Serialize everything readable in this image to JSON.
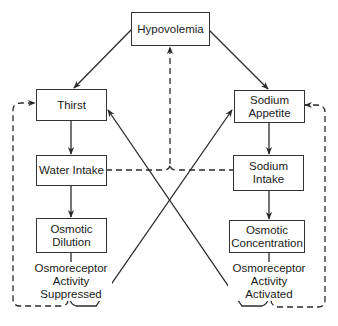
{
  "diagram": {
    "nodes": {
      "hypovolemia": "Hypovolemia",
      "thirst": "Thirst",
      "sodium_appetite": [
        "Sodium",
        "Appetite"
      ],
      "water_intake": "Water Intake",
      "sodium_intake": [
        "Sodium",
        "Intake"
      ],
      "osmotic_dilution": [
        "Osmotic",
        "Dilution"
      ],
      "osmotic_concentration": [
        "Osmotic",
        "Concentration"
      ]
    },
    "labels": {
      "osmoreceptor_suppressed": [
        "Osmoreceptor",
        "Activity",
        "Suppressed"
      ],
      "osmoreceptor_activated": [
        "Osmoreceptor",
        "Activity",
        "Activated"
      ]
    },
    "edges": [
      {
        "from": "hypovolemia",
        "to": "thirst",
        "style": "solid"
      },
      {
        "from": "hypovolemia",
        "to": "sodium_appetite",
        "style": "solid"
      },
      {
        "from": "thirst",
        "to": "water_intake",
        "style": "solid"
      },
      {
        "from": "water_intake",
        "to": "osmotic_dilution",
        "style": "solid"
      },
      {
        "from": "sodium_appetite",
        "to": "sodium_intake",
        "style": "solid"
      },
      {
        "from": "sodium_intake",
        "to": "osmotic_concentration",
        "style": "solid"
      },
      {
        "from": "osmoreceptor_suppressed",
        "to": "sodium_appetite",
        "style": "solid"
      },
      {
        "from": "osmoreceptor_activated",
        "to": "thirst",
        "style": "solid"
      },
      {
        "from": "water_intake+sodium_intake",
        "to": "hypovolemia",
        "style": "dashed"
      },
      {
        "from": "osmoreceptor_suppressed",
        "to": "thirst",
        "style": "dashed"
      },
      {
        "from": "osmoreceptor_activated",
        "to": "sodium_appetite",
        "style": "dashed"
      }
    ],
    "colors": {
      "line": "#2a2a2a",
      "background": "#ffffff"
    }
  }
}
